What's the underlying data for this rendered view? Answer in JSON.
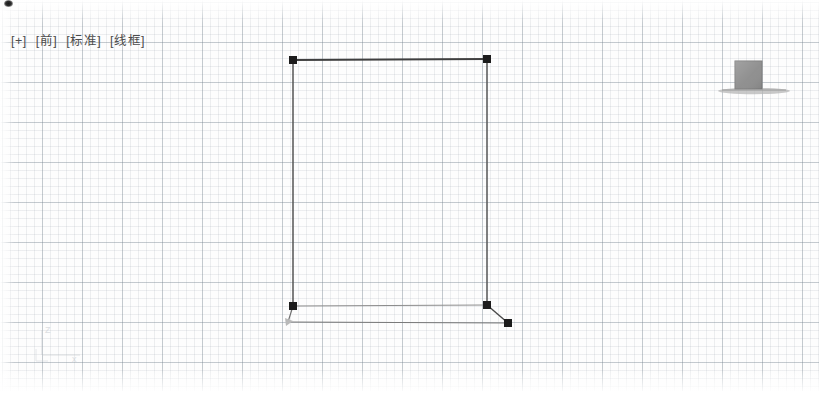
{
  "viewport": {
    "label_parts": [
      "[+]",
      "[前]",
      "[标准]",
      "[线框]"
    ],
    "expand_label": "[+]",
    "view_label": "[前]",
    "visual_style_preset_label": "[标准]",
    "visual_style_label": "[线框]",
    "background_color": "#fdfdfd",
    "grid_minor_color": "#96a0aa",
    "grid_major_color": "#7884 91",
    "grid_minor_spacing_px": 8,
    "grid_major_spacing_px": 40
  },
  "ucs_icon": {
    "name": "ucs-axis-icon",
    "z_axis_label": "Z",
    "x_axis_label": "x",
    "color": "#c9cdd2",
    "origin_x": 42,
    "origin_y": 355
  },
  "geometry": {
    "entity_color": "#4a4a4a",
    "grip_color": "#1c1c1c",
    "main_box": {
      "name": "box-wireframe",
      "top_left": [
        293,
        60
      ],
      "top_right": [
        487,
        59
      ],
      "bottom_left": [
        293,
        306
      ],
      "bottom_right": [
        487,
        305
      ],
      "back_bottom_left": [
        288,
        322
      ],
      "back_bottom_right": [
        508,
        323
      ]
    },
    "grips": [
      {
        "name": "grip-top-left",
        "x": 293,
        "y": 60,
        "size": 8
      },
      {
        "name": "grip-top-right",
        "x": 487,
        "y": 59,
        "size": 8
      },
      {
        "name": "grip-bottom-left",
        "x": 293,
        "y": 306,
        "size": 8
      },
      {
        "name": "grip-bottom-right",
        "x": 487,
        "y": 305,
        "size": 8
      },
      {
        "name": "grip-back-bottom-right",
        "x": 508,
        "y": 323,
        "size": 8
      }
    ],
    "secondary_solid": {
      "name": "gray-solid-block",
      "fill_color": "#8e8e8e",
      "x": 735,
      "y": 61,
      "width": 27,
      "height": 28,
      "shadow_ellipse": {
        "cx": 754,
        "cy": 91,
        "rx": 36,
        "ry": 3,
        "color": "#a8a8a8"
      }
    }
  }
}
